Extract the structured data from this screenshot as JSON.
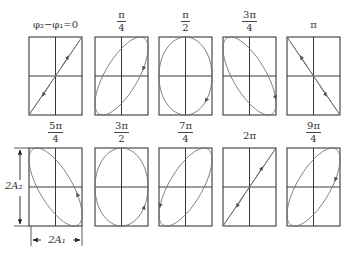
{
  "figure": {
    "title_fragment": "",
    "caption_fragment": "",
    "colors": {
      "frame": "#3a3a3a",
      "curve": "#707070",
      "text": "#333333"
    },
    "panels": [
      {
        "label_type": "plain",
        "label": "φ₂−φ₁=0",
        "phase": "0",
        "shape": "line-pos",
        "direction": "up-right-and-down-left",
        "row": 0,
        "col": 0
      },
      {
        "label_type": "frac",
        "num": "π",
        "den": "4",
        "phase": "π/4",
        "shape": "ellipse-pos",
        "direction": "clockwise",
        "row": 0,
        "col": 1
      },
      {
        "label_type": "frac",
        "num": "π",
        "den": "2",
        "phase": "π/2",
        "shape": "ellipse-upright",
        "direction": "clockwise",
        "row": 0,
        "col": 2
      },
      {
        "label_type": "frac",
        "num": "3π",
        "den": "4",
        "phase": "3π/4",
        "shape": "ellipse-neg",
        "direction": "clockwise",
        "row": 0,
        "col": 3
      },
      {
        "label_type": "plain",
        "label": "π",
        "phase": "π",
        "shape": "line-neg",
        "direction": "up-left-and-down-right",
        "row": 0,
        "col": 4
      },
      {
        "label_type": "frac",
        "num": "5π",
        "den": "4",
        "phase": "5π/4",
        "shape": "ellipse-neg",
        "direction": "counterclockwise",
        "row": 1,
        "col": 0
      },
      {
        "label_type": "frac",
        "num": "3π",
        "den": "2",
        "phase": "3π/2",
        "shape": "ellipse-upright",
        "direction": "counterclockwise",
        "row": 1,
        "col": 1
      },
      {
        "label_type": "frac",
        "num": "7π",
        "den": "4",
        "phase": "7π/4",
        "shape": "ellipse-pos",
        "direction": "counterclockwise",
        "row": 1,
        "col": 2
      },
      {
        "label_type": "plain",
        "label": "2π",
        "phase": "2π",
        "shape": "line-pos",
        "direction": "up-right-and-down-left",
        "row": 1,
        "col": 3
      },
      {
        "label_type": "frac",
        "num": "9π",
        "den": "4",
        "phase": "9π/4",
        "shape": "ellipse-pos",
        "direction": "clockwise",
        "row": 1,
        "col": 4
      }
    ],
    "dimensions": {
      "vertical_label": "2A₂",
      "horizontal_label": "2A₁"
    }
  }
}
